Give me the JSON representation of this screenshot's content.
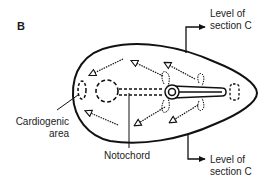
{
  "figure": {
    "panel_label": "B",
    "labels": {
      "section_top": [
        "Level of",
        "section C"
      ],
      "section_bottom": [
        "Level of",
        "section C"
      ],
      "cardiogenic": [
        "Cardiogenic",
        "area"
      ],
      "notochord": "Notochord"
    },
    "colors": {
      "stroke": "#111111",
      "background": "#ffffff"
    }
  }
}
